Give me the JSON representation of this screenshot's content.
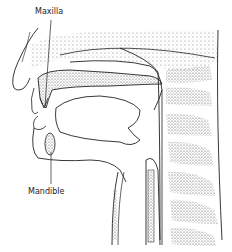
{
  "diagram": {
    "labels": {
      "maxilla": "Maxilla",
      "mandible": "Mandible"
    },
    "colors": {
      "line": "#222222",
      "stipple": "#555555",
      "background": "#ffffff"
    }
  }
}
